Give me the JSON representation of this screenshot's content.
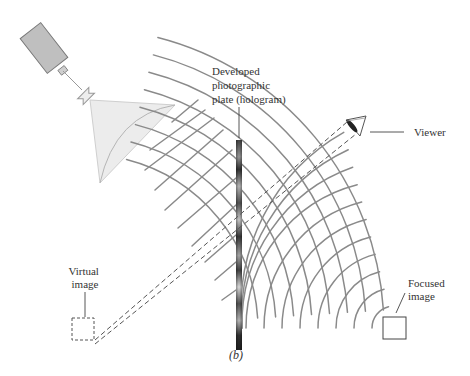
{
  "figure": {
    "panel_label": "(b)",
    "labels": {
      "plate": [
        "Developed",
        "photographic",
        "plate (hologram)"
      ],
      "viewer": "Viewer",
      "virtual_image": [
        "Virtual",
        "image"
      ],
      "focused_image": [
        "Focused",
        "image"
      ]
    },
    "components": [
      "laser",
      "beam-expander-lens",
      "light-cone",
      "plane-waves",
      "hologram-plate",
      "diffracted-arcs",
      "viewer-eye",
      "virtual-image-box",
      "focused-image-box",
      "sight-lines"
    ],
    "colors": {
      "laser_body": "#bfbfbf",
      "light_cone": "#ececec",
      "wavefront": "#8a8a8a",
      "plate_dark": "#3a3a3a",
      "text": "#333333"
    }
  }
}
